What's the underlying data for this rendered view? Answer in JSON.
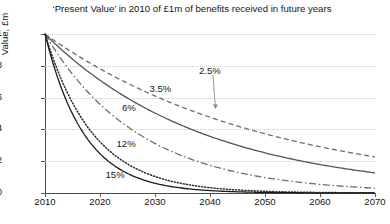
{
  "chart_data": {
    "type": "line",
    "title": "‘Present Value’ in 2010 of £1m of benefits received in future years",
    "xlabel": "",
    "ylabel": "Value, £m",
    "xlim": [
      2010,
      2070
    ],
    "ylim": [
      0,
      1
    ],
    "grid": true,
    "legend_position": "inline-annotations",
    "xticks": [
      "2010",
      "2020",
      "2030",
      "2040",
      "2050",
      "2060",
      "2070"
    ],
    "yticks": [
      "0",
      "0.2",
      "0.4",
      "0.6",
      "0.8",
      "1"
    ],
    "x": [
      2010,
      2015,
      2020,
      2025,
      2030,
      2035,
      2040,
      2045,
      2050,
      2055,
      2060,
      2065,
      2070
    ],
    "series": [
      {
        "name": "2.5%",
        "rate": 0.025,
        "style": "dashed",
        "color": "#6e6e6e",
        "values": [
          1.0,
          0.884,
          0.781,
          0.69,
          0.61,
          0.539,
          0.476,
          0.421,
          0.372,
          0.329,
          0.291,
          0.257,
          0.227
        ]
      },
      {
        "name": "3.5%",
        "rate": 0.035,
        "style": "solid",
        "color": "#545454",
        "values": [
          1.0,
          0.842,
          0.709,
          0.597,
          0.503,
          0.423,
          0.356,
          0.3,
          0.253,
          0.213,
          0.179,
          0.151,
          0.127
        ]
      },
      {
        "name": "6%",
        "rate": 0.06,
        "style": "dash-dot",
        "color": "#6e6e6e",
        "values": [
          1.0,
          0.747,
          0.558,
          0.417,
          0.312,
          0.233,
          0.174,
          0.13,
          0.097,
          0.073,
          0.054,
          0.04,
          0.03
        ]
      },
      {
        "name": "12%",
        "rate": 0.12,
        "style": "dotted",
        "color": "#2b2b2b",
        "values": [
          1.0,
          0.567,
          0.322,
          0.183,
          0.104,
          0.059,
          0.033,
          0.019,
          0.011,
          0.006,
          0.003,
          0.002,
          0.001
        ]
      },
      {
        "name": "15%",
        "rate": 0.15,
        "style": "solid",
        "color": "#1a1a1a",
        "values": [
          1.0,
          0.497,
          0.247,
          0.123,
          0.061,
          0.03,
          0.015,
          0.007,
          0.004,
          0.002,
          0.001,
          0.0,
          0.0
        ]
      }
    ],
    "annotations": [
      {
        "text": "2.5%",
        "x": 2038,
        "y": 0.76,
        "arrow_to": {
          "x": 2041,
          "y": 0.53
        }
      },
      {
        "text": "3.5%",
        "x": 2029,
        "y": 0.645
      },
      {
        "text": "6%",
        "x": 2024,
        "y": 0.53
      },
      {
        "text": "12%",
        "x": 2023,
        "y": 0.3
      },
      {
        "text": "15%",
        "x": 2021,
        "y": 0.105
      }
    ]
  }
}
